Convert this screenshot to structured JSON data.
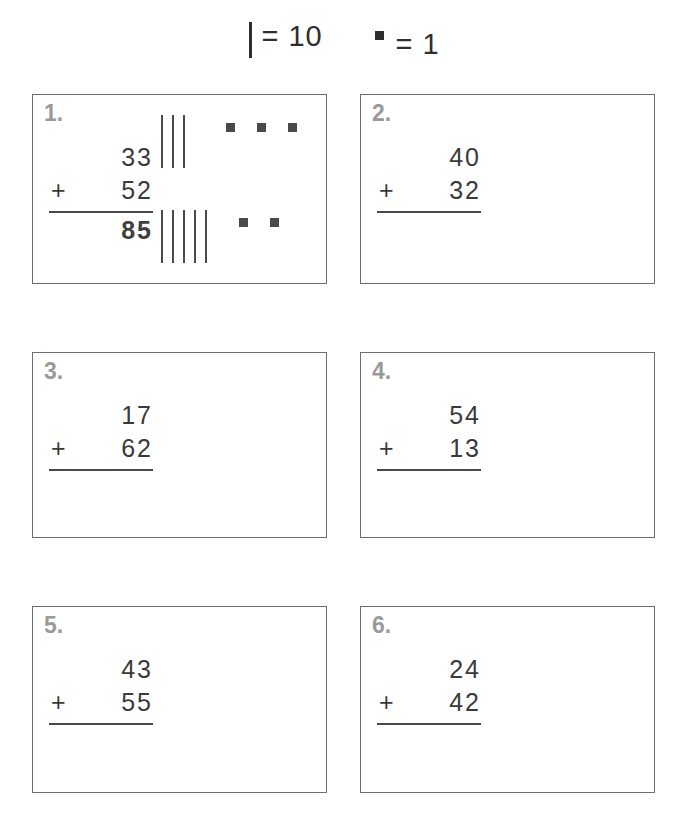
{
  "legend": {
    "tens": {
      "symbol": "tally-bar",
      "text": "= 10"
    },
    "ones": {
      "symbol": "unit-square",
      "text": "= 1"
    }
  },
  "problems": [
    {
      "number": "1.",
      "addend1": "33",
      "addend2": "52",
      "operator": "+",
      "answer": "85",
      "answered": true,
      "marks": {
        "row1": {
          "tens": 3,
          "ones": 3
        },
        "row2": {
          "tens": 5,
          "ones": 2
        }
      }
    },
    {
      "number": "2.",
      "addend1": "40",
      "addend2": "32",
      "operator": "+",
      "answer": "",
      "answered": false,
      "marks": null
    },
    {
      "number": "3.",
      "addend1": "17",
      "addend2": "62",
      "operator": "+",
      "answer": "",
      "answered": false,
      "marks": null
    },
    {
      "number": "4.",
      "addend1": "54",
      "addend2": "13",
      "operator": "+",
      "answer": "",
      "answered": false,
      "marks": null
    },
    {
      "number": "5.",
      "addend1": "43",
      "addend2": "55",
      "operator": "+",
      "answer": "",
      "answered": false,
      "marks": null
    },
    {
      "number": "6.",
      "addend1": "24",
      "addend2": "42",
      "operator": "+",
      "answer": "",
      "answered": false,
      "marks": null
    }
  ],
  "colors": {
    "ink": "#3a3a3a",
    "mark": "#4a4a4a",
    "number_label": "#9a9a9a",
    "box_border": "#6e6e6e",
    "page": "#ffffff"
  }
}
